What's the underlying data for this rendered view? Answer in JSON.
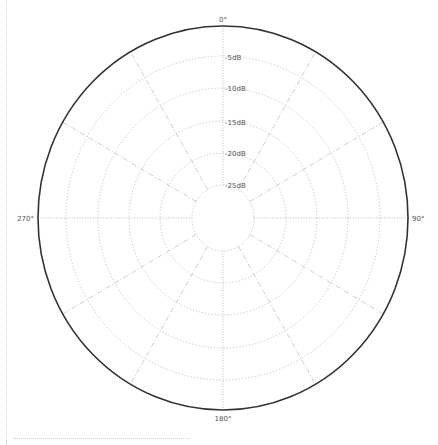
{
  "chart_data": {
    "type": "polar",
    "title": "",
    "angle_labels": [
      "0°",
      "90°",
      "180°",
      "270°"
    ],
    "angle_spokes_deg": [
      0,
      30,
      60,
      90,
      120,
      150,
      180,
      210,
      240,
      270,
      300,
      330
    ],
    "radial_labels": [
      "-5dB",
      "-10dB",
      "-15dB",
      "-20dB",
      "-25dB"
    ],
    "radial_values_db": [
      0,
      -5,
      -10,
      -15,
      -20,
      -25,
      -30
    ],
    "rlim": [
      -30,
      0
    ],
    "grid": true,
    "series": [],
    "colors": {
      "outer": "#333333",
      "grid": "#aaaaaa",
      "text": "#555555"
    }
  },
  "labels": {
    "top": "0°",
    "right": "90°",
    "bottom": "180°",
    "left": "270°",
    "r5": "-5dB",
    "r10": "-10dB",
    "r15": "-15dB",
    "r20": "-20dB",
    "r25": "-25dB"
  }
}
